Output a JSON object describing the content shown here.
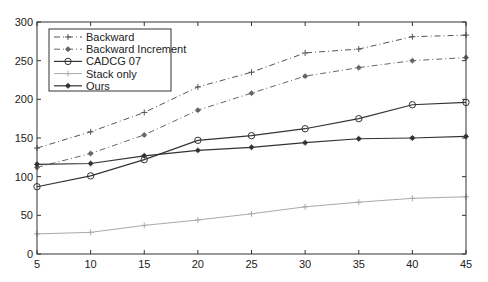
{
  "chart_data": {
    "type": "line",
    "title": "",
    "xlabel": "",
    "ylabel": "",
    "x": [
      5,
      10,
      15,
      20,
      25,
      30,
      35,
      40,
      45
    ],
    "xlim": [
      5,
      45
    ],
    "ylim": [
      0,
      300
    ],
    "xticks": [
      5,
      10,
      15,
      20,
      25,
      30,
      35,
      40,
      45
    ],
    "yticks": [
      0,
      50,
      100,
      150,
      200,
      250,
      300
    ],
    "grid": false,
    "legend_position": "upper left",
    "series": [
      {
        "name": "Backward",
        "style": "dash-dot",
        "marker": "+",
        "color": "#555555",
        "width": 1,
        "values": [
          137,
          158,
          183,
          216,
          235,
          260,
          265,
          281,
          283
        ]
      },
      {
        "name": "Backward Increment",
        "style": "dash-dot",
        "marker": "*",
        "color": "#666666",
        "width": 1,
        "values": [
          112,
          130,
          154,
          186,
          208,
          230,
          241,
          250,
          254
        ]
      },
      {
        "name": "CADCG 07",
        "style": "solid",
        "marker": "o",
        "color": "#333333",
        "width": 1.2,
        "values": [
          87,
          101,
          122,
          147,
          153,
          162,
          175,
          193,
          196
        ]
      },
      {
        "name": "Stack only",
        "style": "solid",
        "marker": "+",
        "color": "#aaaaaa",
        "width": 1,
        "values": [
          26,
          28,
          37,
          44,
          52,
          61,
          67,
          72,
          74
        ]
      },
      {
        "name": "Ours",
        "style": "solid",
        "marker": "*",
        "color": "#333333",
        "width": 1.2,
        "values": [
          116,
          117,
          127,
          134,
          138,
          144,
          149,
          150,
          152
        ]
      }
    ]
  }
}
